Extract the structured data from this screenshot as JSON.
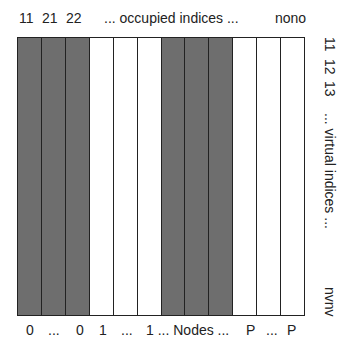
{
  "top_labels": {
    "l1": "11",
    "l2": "21",
    "l3": "22",
    "middle": "... occupied indices ...",
    "end": "nono"
  },
  "right_labels": {
    "r1": "11",
    "r2": "12",
    "r3": "13",
    "middle": "... virtual indices ...",
    "end": "nvnv"
  },
  "bottom_labels": {
    "b1": "0",
    "b2": "...",
    "b3": "0",
    "b4": "1",
    "b5": "...",
    "b6": "1 ... Nodes ...",
    "b7": "P",
    "b8": "...",
    "b9": "P"
  },
  "grid": {
    "columns": 12,
    "occupied_columns": [
      0,
      1,
      2,
      6,
      7,
      8
    ],
    "occupied_color": "#6e6e6e",
    "free_color": "#ffffff"
  }
}
